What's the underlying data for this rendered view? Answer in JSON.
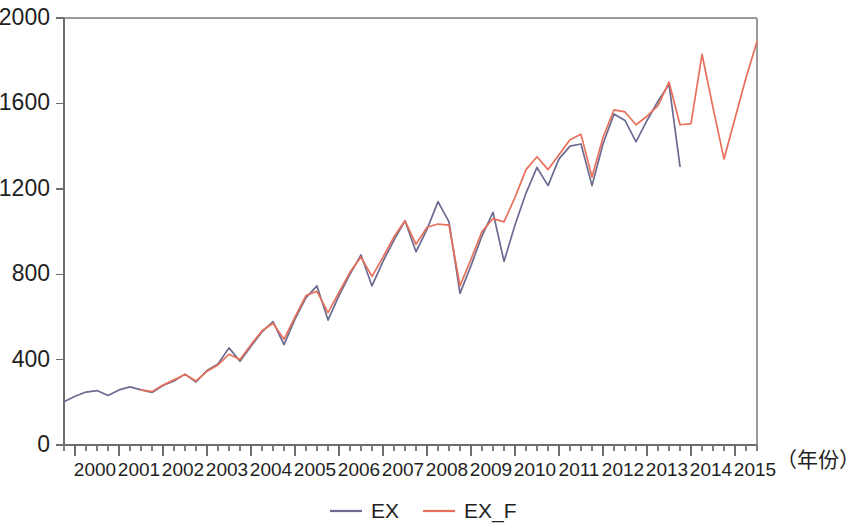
{
  "chart_data": {
    "type": "line",
    "title": "",
    "subtitle": "",
    "xlabel": "（年份）",
    "ylabel": "",
    "ylim": [
      0,
      2000
    ],
    "yticks": [
      0,
      400,
      800,
      1200,
      1600,
      2000
    ],
    "xticks": [
      "2000",
      "2001",
      "2002",
      "2003",
      "2004",
      "2005",
      "2006",
      "2007",
      "2008",
      "2009",
      "2010",
      "2011",
      "2012",
      "2013",
      "2014",
      "2015"
    ],
    "x_minor_ticks_per_major": 3,
    "x_tick_note": "quarterly minor ticks between year labels",
    "grid": false,
    "legend_position": "bottom-center",
    "frequency": "quarterly",
    "x_start": "1999Q4",
    "x_end": "2015Q3",
    "series": [
      {
        "name": "EX",
        "color": "#6b6b92",
        "x": [
          "1999Q4",
          "2000Q1",
          "2000Q2",
          "2000Q3",
          "2000Q4",
          "2001Q1",
          "2001Q2",
          "2001Q3",
          "2001Q4",
          "2002Q1",
          "2002Q2",
          "2002Q3",
          "2002Q4",
          "2003Q1",
          "2003Q2",
          "2003Q3",
          "2003Q4",
          "2004Q1",
          "2004Q2",
          "2004Q3",
          "2004Q4",
          "2005Q1",
          "2005Q2",
          "2005Q3",
          "2005Q4",
          "2006Q1",
          "2006Q2",
          "2006Q3",
          "2006Q4",
          "2007Q1",
          "2007Q2",
          "2007Q3",
          "2007Q4",
          "2008Q1",
          "2008Q2",
          "2008Q3",
          "2008Q4",
          "2009Q1",
          "2009Q2",
          "2009Q3",
          "2009Q4",
          "2010Q1",
          "2010Q2",
          "2010Q3",
          "2010Q4",
          "2011Q1",
          "2011Q2",
          "2011Q3",
          "2011Q4",
          "2012Q1",
          "2012Q2",
          "2012Q3",
          "2012Q4",
          "2013Q1",
          "2013Q2",
          "2013Q3",
          "2013Q4"
        ],
        "values": [
          203,
          228,
          248,
          255,
          232,
          258,
          272,
          258,
          246,
          279,
          300,
          332,
          295,
          349,
          379,
          455,
          392,
          463,
          530,
          578,
          470,
          590,
          690,
          745,
          585,
          700,
          800,
          890,
          745,
          860,
          960,
          1050,
          905,
          1010,
          1140,
          1045,
          710,
          840,
          980,
          1090,
          860,
          1030,
          1180,
          1300,
          1215,
          1340,
          1400,
          1410,
          1215,
          1410,
          1550,
          1520,
          1420,
          1520,
          1610,
          1690,
          1305
        ]
      },
      {
        "name": "EX_F",
        "color": "#e8705a",
        "x": [
          "2001Q3",
          "2001Q4",
          "2002Q1",
          "2002Q2",
          "2002Q3",
          "2002Q4",
          "2003Q1",
          "2003Q2",
          "2003Q3",
          "2003Q4",
          "2004Q1",
          "2004Q2",
          "2004Q3",
          "2004Q4",
          "2005Q1",
          "2005Q2",
          "2005Q3",
          "2005Q4",
          "2006Q1",
          "2006Q2",
          "2006Q3",
          "2006Q4",
          "2007Q1",
          "2007Q2",
          "2007Q3",
          "2007Q4",
          "2008Q1",
          "2008Q2",
          "2008Q3",
          "2008Q4",
          "2009Q1",
          "2009Q2",
          "2009Q3",
          "2009Q4",
          "2010Q1",
          "2010Q2",
          "2010Q3",
          "2010Q4",
          "2011Q1",
          "2011Q2",
          "2011Q3",
          "2011Q4",
          "2012Q1",
          "2012Q2",
          "2012Q3",
          "2012Q4",
          "2013Q1",
          "2013Q2",
          "2013Q3",
          "2013Q4",
          "2014Q1",
          "2014Q2",
          "2014Q3",
          "2014Q4",
          "2015Q1",
          "2015Q2",
          "2015Q3"
        ],
        "values": [
          258,
          250,
          281,
          305,
          330,
          300,
          345,
          375,
          425,
          400,
          470,
          535,
          570,
          495,
          600,
          700,
          720,
          620,
          715,
          810,
          880,
          790,
          880,
          975,
          1050,
          940,
          1020,
          1035,
          1030,
          745,
          870,
          1000,
          1060,
          1045,
          1160,
          1290,
          1350,
          1290,
          1360,
          1430,
          1455,
          1255,
          1440,
          1570,
          1560,
          1500,
          1540,
          1590,
          1700,
          1500,
          1505,
          1830,
          1580,
          1340,
          1530,
          1720,
          1890
        ]
      }
    ]
  },
  "legend": {
    "items": [
      {
        "label": "EX",
        "color": "#6b6b92"
      },
      {
        "label": "EX_F",
        "color": "#e8705a"
      }
    ]
  },
  "axes": {
    "y_tick_labels": [
      "2000",
      "1600",
      "1200",
      "800",
      "400",
      "0"
    ],
    "x_tick_labels": [
      "2000",
      "2001",
      "2002",
      "2003",
      "2004",
      "2005",
      "2006",
      "2007",
      "2008",
      "2009",
      "2010",
      "2011",
      "2012",
      "2013",
      "2014",
      "2015"
    ],
    "x_axis_caption": "（年份）"
  }
}
